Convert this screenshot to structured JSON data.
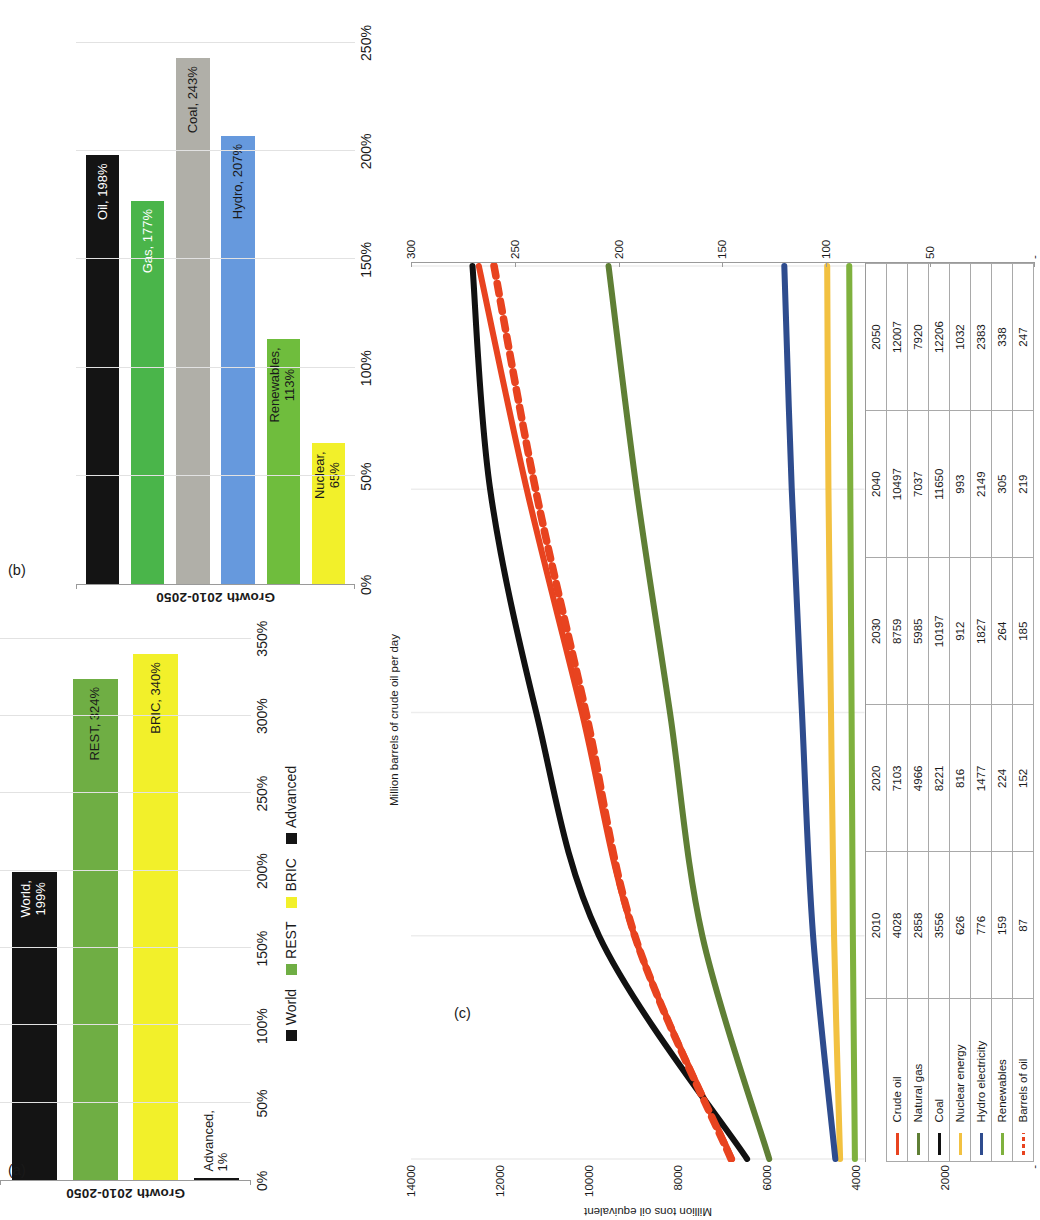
{
  "figure": {
    "panel_a_tag": "(a)",
    "panel_b_tag": "(b)",
    "panel_c_tag": "(c)"
  },
  "chart_data": [
    {
      "id": "panel_a",
      "type": "bar",
      "orientation": "horizontal",
      "title": "",
      "xlabel": "",
      "ylabel": "Growth 2010-2050",
      "categories": [
        "World",
        "REST",
        "BRIC",
        "Advanced"
      ],
      "values": [
        199,
        324,
        340,
        1
      ],
      "bar_labels": [
        "World,\n199%",
        "REST, 324%",
        "BRIC, 340%",
        "Advanced,\n1%"
      ],
      "colors": [
        "#141414",
        "#6FAE44",
        "#F2F02A",
        "#141414"
      ],
      "label_colors": [
        "#ffffff",
        "#1a1a1a",
        "#1a1a1a",
        "#1a1a1a"
      ],
      "label_outside": [
        false,
        false,
        false,
        true
      ],
      "xlim": [
        0,
        375
      ],
      "xticks": [
        0,
        50,
        100,
        150,
        200,
        250,
        300,
        350
      ],
      "xticklabels": [
        "0%",
        "50%",
        "100%",
        "150%",
        "200%",
        "250%",
        "300%",
        "350%"
      ],
      "grid": true,
      "legend_position": "bottom",
      "legend": [
        {
          "label": "World",
          "color": "#141414"
        },
        {
          "label": "REST",
          "color": "#6FAE44"
        },
        {
          "label": "BRIC",
          "color": "#F2F02A"
        },
        {
          "label": "Advanced",
          "color": "#141414"
        }
      ]
    },
    {
      "id": "panel_b",
      "type": "bar",
      "orientation": "horizontal",
      "title": "",
      "xlabel": "",
      "ylabel": "Growth 2010-2050",
      "categories": [
        "Oil",
        "Gas",
        "Coal",
        "Hydro",
        "Renewables",
        "Nuclear"
      ],
      "values": [
        198,
        177,
        243,
        207,
        113,
        65
      ],
      "bar_labels": [
        "Oil, 198%",
        "Gas, 177%",
        "Coal, 243%",
        "Hydro, 207%",
        "Renewables,\n113%",
        "Nuclear,\n65%"
      ],
      "colors": [
        "#141414",
        "#4AB54A",
        "#B0AFA8",
        "#6699DD",
        "#6FBD3D",
        "#F2F02A"
      ],
      "label_colors": [
        "#ffffff",
        "#ffffff",
        "#1a1a1a",
        "#1a1a1a",
        "#1a1a1a",
        "#1a1a1a"
      ],
      "label_outside": [
        false,
        false,
        false,
        false,
        false,
        false
      ],
      "xlim": [
        0,
        268
      ],
      "xticks": [
        0,
        50,
        100,
        150,
        200,
        250
      ],
      "xticklabels": [
        "0%",
        "50%",
        "100%",
        "150%",
        "200%",
        "250%"
      ],
      "grid": true,
      "legend_position": "none",
      "legend": []
    },
    {
      "id": "panel_c",
      "type": "line",
      "title": "",
      "ylabel": "Million tons oil equivalent",
      "ylabel_secondary": "Million barrels of crude oil per day",
      "x": [
        "2010",
        "2020",
        "2030",
        "2040",
        "2050"
      ],
      "ylim": [
        0,
        14000
      ],
      "yticks": [
        0,
        2000,
        4000,
        6000,
        8000,
        10000,
        12000,
        14000
      ],
      "yticklabels": [
        "-",
        "2000",
        "4000",
        "6000",
        "8000",
        "10000",
        "12000",
        "14000"
      ],
      "ylim_secondary": [
        0,
        300
      ],
      "yticks_secondary": [
        0,
        50,
        100,
        150,
        200,
        250,
        300
      ],
      "yticklabels_secondary": [
        "-",
        "50",
        "100",
        "150",
        "200",
        "250",
        "300"
      ],
      "grid": true,
      "legend_position": "table-left",
      "series": [
        {
          "name": "Crude oil",
          "color": "#E8431F",
          "style": "solid",
          "axis": "left",
          "values": [
            4028,
            7103,
            8759,
            10497,
            12007
          ]
        },
        {
          "name": "Natural gas",
          "color": "#5F7F35",
          "style": "solid",
          "axis": "left",
          "values": [
            2858,
            4966,
            5985,
            7037,
            7920
          ]
        },
        {
          "name": "Coal",
          "color": "#111111",
          "style": "solid",
          "axis": "left",
          "values": [
            3556,
            8221,
            10197,
            11650,
            12206
          ]
        },
        {
          "name": "Nuclear energy",
          "color": "#F2C141",
          "style": "solid",
          "axis": "left",
          "values": [
            626,
            816,
            912,
            993,
            1032
          ]
        },
        {
          "name": "Hydro electricity",
          "color": "#2E4C8E",
          "style": "solid",
          "axis": "left",
          "values": [
            776,
            1477,
            1827,
            2149,
            2383
          ]
        },
        {
          "name": "Renewables",
          "color": "#7FB13E",
          "style": "solid",
          "axis": "left",
          "values": [
            159,
            224,
            264,
            305,
            338
          ]
        },
        {
          "name": "Barrels of oil",
          "color": "#E8431F",
          "style": "dashed",
          "axis": "secondary",
          "values": [
            87,
            152,
            185,
            219,
            247
          ]
        }
      ],
      "table": {
        "columns": [
          "2010",
          "2020",
          "2030",
          "2040",
          "2050"
        ],
        "rows": [
          {
            "label": "Crude oil",
            "color": "#E8431F",
            "style": "solid",
            "cells": [
              "4028",
              "7103",
              "8759",
              "10497",
              "12007"
            ]
          },
          {
            "label": "Natural gas",
            "color": "#5F7F35",
            "style": "solid",
            "cells": [
              "2858",
              "4966",
              "5985",
              "7037",
              "7920"
            ]
          },
          {
            "label": "Coal",
            "color": "#111111",
            "style": "solid",
            "cells": [
              "3556",
              "8221",
              "10197",
              "11650",
              "12206"
            ]
          },
          {
            "label": "Nuclear energy",
            "color": "#F2C141",
            "style": "solid",
            "cells": [
              "626",
              "816",
              "912",
              "993",
              "1032"
            ]
          },
          {
            "label": "Hydro electricity",
            "color": "#2E4C8E",
            "style": "solid",
            "cells": [
              "776",
              "1477",
              "1827",
              "2149",
              "2383"
            ]
          },
          {
            "label": "Renewables",
            "color": "#7FB13E",
            "style": "solid",
            "cells": [
              "159",
              "224",
              "264",
              "305",
              "338"
            ]
          },
          {
            "label": "Barrels of oil",
            "color": "#E8431F",
            "style": "dashed",
            "cells": [
              "87",
              "152",
              "185",
              "219",
              "247"
            ]
          }
        ]
      }
    }
  ]
}
